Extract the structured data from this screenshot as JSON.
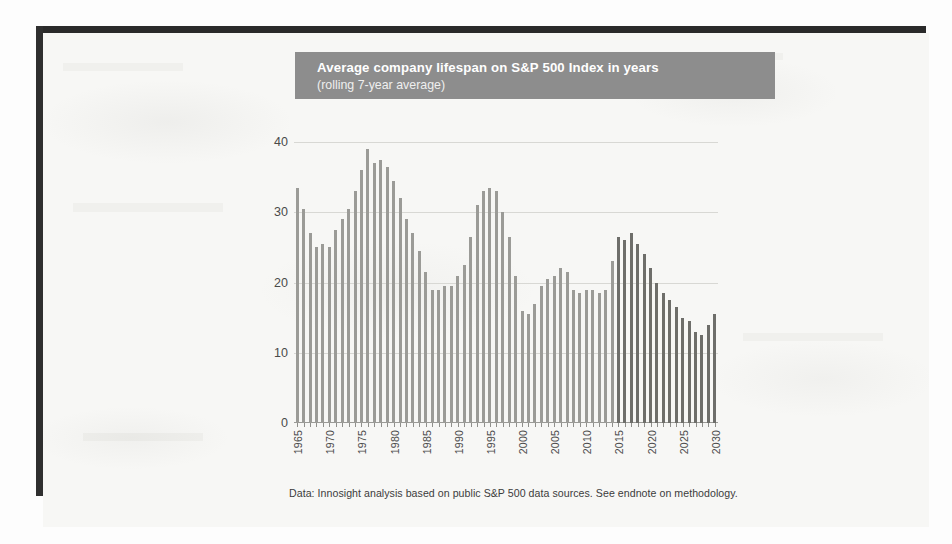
{
  "figure": {
    "title_main": "Average company lifespan on S&P 500 Index in years",
    "title_sub": "(rolling 7-year average)",
    "footnote": "Data: Innosight analysis based on public S&P 500 data sources. See endnote on methodology.",
    "title_band_color": "#8d8d8d",
    "bar_color_historical": "#9b9b97",
    "bar_color_projected": "#6e6e6a",
    "page_background": "#f7f7f5",
    "frame_color": "#2a2a2a"
  },
  "chart_data": {
    "type": "bar",
    "title": "Average company lifespan on S&P 500 Index in years",
    "subtitle": "(rolling 7-year average)",
    "xlabel": "",
    "ylabel": "",
    "ylim": [
      0,
      42
    ],
    "yticks": [
      0,
      10,
      20,
      30,
      40
    ],
    "grid": true,
    "legend": null,
    "xticks": [
      1965,
      1970,
      1975,
      1980,
      1985,
      1990,
      1995,
      2000,
      2005,
      2010,
      2015,
      2020,
      2025,
      2030
    ],
    "categories": [
      1965,
      1966,
      1967,
      1968,
      1969,
      1970,
      1971,
      1972,
      1973,
      1974,
      1975,
      1976,
      1977,
      1978,
      1979,
      1980,
      1981,
      1982,
      1983,
      1984,
      1985,
      1986,
      1987,
      1988,
      1989,
      1990,
      1991,
      1992,
      1993,
      1994,
      1995,
      1996,
      1997,
      1998,
      1999,
      2000,
      2001,
      2002,
      2003,
      2004,
      2005,
      2006,
      2007,
      2008,
      2009,
      2010,
      2011,
      2012,
      2013,
      2014,
      2015,
      2016,
      2017,
      2018,
      2019,
      2020,
      2021,
      2022,
      2023,
      2024,
      2025,
      2026,
      2027,
      2028,
      2029,
      2030
    ],
    "values": [
      33.5,
      30.5,
      27.0,
      25.0,
      25.5,
      25.0,
      27.5,
      29.0,
      30.5,
      33.0,
      36.0,
      39.0,
      37.0,
      37.5,
      36.5,
      34.5,
      32.0,
      29.0,
      27.0,
      24.5,
      21.5,
      19.0,
      19.0,
      19.5,
      19.5,
      21.0,
      22.5,
      26.5,
      31.0,
      33.0,
      33.5,
      33.0,
      30.0,
      26.5,
      21.0,
      16.0,
      15.5,
      17.0,
      19.5,
      20.5,
      21.0,
      22.0,
      21.5,
      19.0,
      18.5,
      19.0,
      19.0,
      18.5,
      19.0,
      23.0,
      26.5,
      26.0,
      27.0,
      25.5,
      24.0,
      22.0,
      20.0,
      18.5,
      17.5,
      16.5,
      15.0,
      14.5,
      13.0,
      12.5,
      14.0,
      15.5
    ],
    "series": [
      {
        "name": "Historical (1965-2014)",
        "color": "#9b9b97",
        "range": [
          1965,
          2014
        ]
      },
      {
        "name": "Projected (2015-2030)",
        "color": "#6e6e6a",
        "range": [
          2015,
          2030
        ]
      }
    ],
    "projection_start_year": 2015
  }
}
